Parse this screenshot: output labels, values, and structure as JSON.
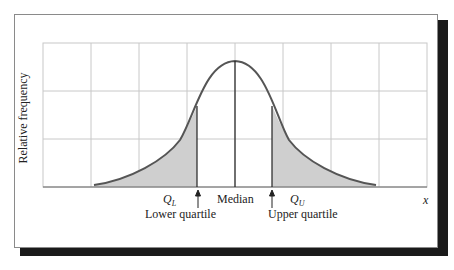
{
  "diagram": {
    "type": "normal-distribution-quartiles",
    "y_axis_label": "Relative frequency",
    "x_axis_label": "x",
    "labels": {
      "q_lower_symbol": "Q",
      "q_lower_sub": "L",
      "q_upper_symbol": "Q",
      "q_upper_sub": "U",
      "median": "Median",
      "lower_quartile": "Lower quartile",
      "upper_quartile": "Upper quartile"
    },
    "colors": {
      "curve": "#555555",
      "shade": "#cfcfcf",
      "grid": "#c8c8c8",
      "shadow": "#1a1a1a"
    },
    "shaded_regions": [
      "left tail below Q_L",
      "right tail above Q_U"
    ]
  }
}
